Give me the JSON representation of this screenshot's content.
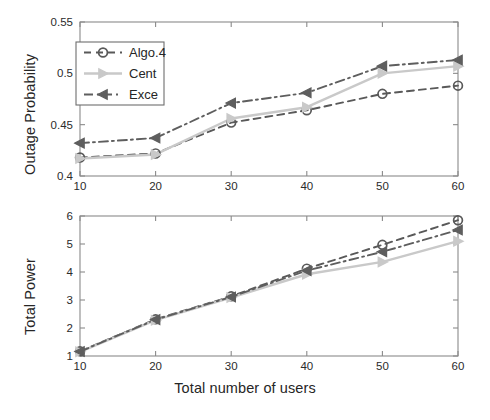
{
  "figure": {
    "background": "#ffffff",
    "series_colors": {
      "algo4": "#595959",
      "cent": "#c9c9c9",
      "exce": "#5e5e5e"
    }
  },
  "chart_data": [
    {
      "type": "line",
      "id": "outage-probability",
      "title": "",
      "xlabel": "",
      "ylabel": "Outage Probability",
      "x": [
        10,
        20,
        30,
        40,
        50,
        60
      ],
      "xticklabels": [
        "10",
        "20",
        "30",
        "40",
        "50",
        "60"
      ],
      "yticklabels": [
        "0.4",
        "0.45",
        "0.5",
        "0.55"
      ],
      "yticks": [
        0.4,
        0.45,
        0.5,
        0.55
      ],
      "xlim": [
        10,
        60
      ],
      "ylim": [
        0.4,
        0.55
      ],
      "grid": false,
      "legend_position": "upper-left",
      "series": [
        {
          "name": "Algo.4",
          "values": [
            0.418,
            0.422,
            0.452,
            0.464,
            0.48,
            0.488
          ],
          "color": "#595959",
          "linestyle": "dashed",
          "marker": "circle"
        },
        {
          "name": "Cent",
          "values": [
            0.417,
            0.421,
            0.456,
            0.467,
            0.5,
            0.507
          ],
          "color": "#c9c9c9",
          "linestyle": "solid",
          "marker": "triangle-right"
        },
        {
          "name": "Exce",
          "values": [
            0.432,
            0.437,
            0.471,
            0.481,
            0.507,
            0.513
          ],
          "color": "#5e5e5e",
          "linestyle": "dash-dot",
          "marker": "triangle-left"
        }
      ]
    },
    {
      "type": "line",
      "id": "total-power",
      "title": "",
      "xlabel": "Total number of users",
      "ylabel": "Total Power",
      "x": [
        10,
        20,
        30,
        40,
        50,
        60
      ],
      "xticklabels": [
        "10",
        "20",
        "30",
        "40",
        "50",
        "60"
      ],
      "yticklabels": [
        "1",
        "2",
        "3",
        "4",
        "5",
        "6"
      ],
      "yticks": [
        1,
        2,
        3,
        4,
        5,
        6
      ],
      "xlim": [
        10,
        60
      ],
      "ylim": [
        1,
        6
      ],
      "grid": false,
      "legend_position": "none",
      "series": [
        {
          "name": "Algo.4",
          "values": [
            1.17,
            2.31,
            3.13,
            4.12,
            4.97,
            5.85
          ],
          "color": "#595959",
          "linestyle": "dashed",
          "marker": "circle"
        },
        {
          "name": "Cent",
          "values": [
            1.15,
            2.28,
            3.09,
            3.92,
            4.36,
            5.1
          ],
          "color": "#c9c9c9",
          "linestyle": "solid",
          "marker": "triangle-right"
        },
        {
          "name": "Exce",
          "values": [
            1.16,
            2.3,
            3.11,
            4.05,
            4.72,
            5.5
          ],
          "color": "#5e5e5e",
          "linestyle": "dash-dot",
          "marker": "triangle-left"
        }
      ]
    }
  ]
}
